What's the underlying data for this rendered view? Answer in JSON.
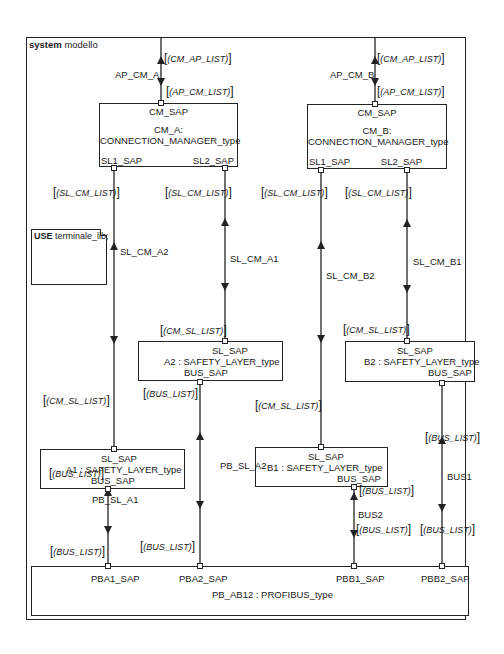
{
  "frame": {
    "keyword": "system",
    "name": "modello"
  },
  "note": {
    "keyword": "USE",
    "text": "terminale_lib;"
  },
  "blocks": {
    "cm_a": {
      "port_top": "CM_SAP",
      "name_line1": "CM_A:",
      "name_line2": "CONNECTION_MANAGER_type",
      "port_left": "SL1_SAP",
      "port_right": "SL2_SAP"
    },
    "cm_b": {
      "port_top": "CM_SAP",
      "name_line1": "CM_B:",
      "name_line2": "CONNECTION_MANAGER_type",
      "port_left": "SL1_SAP",
      "port_right": "SL2_SAP"
    },
    "a2": {
      "port_top": "SL_SAP",
      "name": "A2 : SAFETY_LAYER_type",
      "port_bottom": "BUS_SAP"
    },
    "b2": {
      "port_top": "SL_SAP",
      "name": "B2 : SAFETY_LAYER_type",
      "port_bottom": "BUS_SAP"
    },
    "a1": {
      "port_top": "SL_SAP",
      "name": "A1 : SAFETY_LAYER_type",
      "port_bottom": "BUS_SAP"
    },
    "b1": {
      "port_top": "SL_SAP",
      "name": "B1 : SAFETY_LAYER_type",
      "port_bottom": "BUS_SAP"
    },
    "pb": {
      "name": "PB_AB12 : PROFIBUS_type",
      "ports": [
        "PBA1_SAP",
        "PBA2_SAP",
        "PBB1_SAP",
        "PBB2_SAP"
      ]
    }
  },
  "channels": {
    "ap_cm_a": {
      "name": "AP_CM_A",
      "sig_in": "(CM_AP_LIST)",
      "sig_out": "(AP_CM_LIST)"
    },
    "ap_cm_b": {
      "name": "AP_CM_B",
      "sig_in": "(CM_AP_LIST)",
      "sig_out": "(AP_CM_LIST)"
    },
    "sl_cm_a2": {
      "name": "SL_CM_A2",
      "sig_top": "(SL_CM_LIST)",
      "sig_bottom": "(CM_SL_LIST)"
    },
    "sl_cm_a1": {
      "name": "SL_CM_A1",
      "sig_top": "(SL_CM_LIST)",
      "sig_bottom": "(CM_SL_LIST)"
    },
    "sl_cm_b2": {
      "name": "SL_CM_B2",
      "sig_top": "(SL_CM_LIST)",
      "sig_bottom": "(CM_SL_LIST)"
    },
    "sl_cm_b1": {
      "name": "SL_CM_B1",
      "sig_top": "(SL_CM_LIST)",
      "sig_bottom": "(CM_SL_LIST)"
    },
    "pb_sl_a1": {
      "name": "PB_SL_A1",
      "sig_top": "(BUS_LIST)",
      "sig_bottom": "(BUS_LIST)"
    },
    "pb_sl_a2": {
      "name": "PB_SL_A2",
      "sig_top": "(BUS_LIST)",
      "sig_bottom": "(BUS_LIST)"
    },
    "bus2": {
      "name": "BUS2",
      "sig_top": "(BUS_LIST)",
      "sig_bottom": "(BUS_LIST)"
    },
    "bus1": {
      "name": "BUS1",
      "sig_top": "(BUS_LIST)",
      "sig_bottom": "(BUS_LIST)"
    }
  }
}
